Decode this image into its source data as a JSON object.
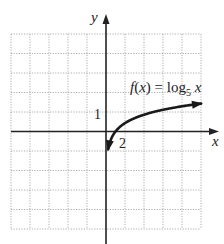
{
  "chart_data": {
    "type": "line",
    "title": "",
    "function_label": "f(x) = log₅ x",
    "function_label_parts": {
      "f": "f",
      "paren_open": "(",
      "x": "x",
      "paren_close": ")",
      "equals": " = log",
      "sub": "5",
      "arg": " x"
    },
    "xlabel": "x",
    "ylabel": "y",
    "xlim": [
      -10,
      10
    ],
    "ylim": [
      -5,
      5
    ],
    "x_grid_step": 2,
    "y_grid_step": 1,
    "grid": true,
    "tick_labels": [
      {
        "axis": "x",
        "value": 2,
        "text": "2"
      },
      {
        "axis": "y",
        "value": 1,
        "text": "1"
      }
    ],
    "series": [
      {
        "name": "f(x) = log5 x",
        "base": 5,
        "x_start": 0.23,
        "x_end": 10,
        "arrows": "both",
        "points": [
          [
            0.23,
            -0.91
          ],
          [
            0.5,
            -0.43
          ],
          [
            1,
            0
          ],
          [
            2,
            0.43
          ],
          [
            3,
            0.68
          ],
          [
            5,
            1
          ],
          [
            7,
            1.21
          ],
          [
            10,
            1.43
          ]
        ]
      }
    ],
    "colors": {
      "grid": "#9a9a9a",
      "axis": "#222222",
      "curve": "#1a1a1a"
    }
  }
}
